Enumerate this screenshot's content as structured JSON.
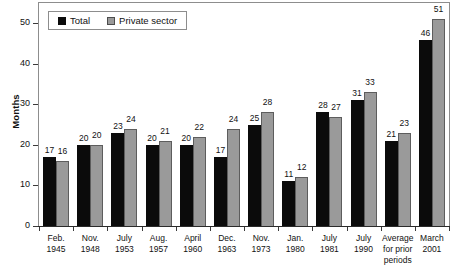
{
  "chart_data": {
    "type": "bar",
    "title": "",
    "xlabel": "",
    "ylabel": "Months",
    "ylim": [
      0,
      55
    ],
    "yticks": [
      0,
      10,
      20,
      30,
      40,
      50
    ],
    "grid": false,
    "legend_position": "top-left",
    "categories": [
      "Feb. 1945",
      "Nov. 1948",
      "July 1953",
      "Aug. 1957",
      "April 1960",
      "Dec. 1963",
      "Nov. 1973",
      "Jan. 1980",
      "July 1981",
      "July 1990",
      "Average for prior periods",
      "March 2001"
    ],
    "category_lines": [
      [
        "Feb.",
        "1945"
      ],
      [
        "Nov.",
        "1948"
      ],
      [
        "July",
        "1953"
      ],
      [
        "Aug.",
        "1957"
      ],
      [
        "April",
        "1960"
      ],
      [
        "Dec.",
        "1963"
      ],
      [
        "Nov.",
        "1973"
      ],
      [
        "Jan.",
        "1980"
      ],
      [
        "July",
        "1981"
      ],
      [
        "July",
        "1990"
      ],
      [
        "Average",
        "for prior",
        "periods"
      ],
      [
        "March",
        "2001"
      ]
    ],
    "series": [
      {
        "name": "Total",
        "color": "#0b0b0b",
        "values": [
          17,
          20,
          23,
          20,
          20,
          17,
          25,
          11,
          28,
          31,
          21,
          46
        ]
      },
      {
        "name": "Private sector",
        "color": "#9a9a9a",
        "values": [
          16,
          20,
          24,
          21,
          22,
          24,
          28,
          12,
          27,
          33,
          23,
          51
        ]
      }
    ]
  },
  "legend": {
    "items": [
      {
        "label": "Total",
        "swatch": "black-square"
      },
      {
        "label": "Private sector",
        "swatch": "gray-square"
      }
    ]
  },
  "axes": {
    "y_title": "Months",
    "y_tick_labels": [
      "50",
      "40",
      "30",
      "20",
      "10",
      "0"
    ]
  },
  "colors": {
    "total_bar": "#0b0b0b",
    "private_bar": "#9a9a9a",
    "frame": "#8d8d8d",
    "text": "#111111",
    "background": "#ffffff"
  }
}
